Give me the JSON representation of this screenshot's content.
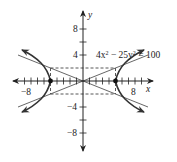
{
  "diagram": {
    "type": "hyperbola-graph",
    "equation": "4x² − 25y² = 100",
    "equation_parts": {
      "a": "4x",
      "sup1": "2",
      "b": " − 25y",
      "sup2": "2",
      "c": " = 100"
    },
    "axes": {
      "x_label": "x",
      "y_label": "y",
      "x_tick_labels": [
        "−8",
        "8"
      ],
      "y_tick_labels": [
        "8",
        "4",
        "−4",
        "−8"
      ],
      "x_range": [
        -10,
        10
      ],
      "y_range": [
        -10,
        10
      ],
      "tick_step": 1
    },
    "vertices": [
      [
        -5,
        0
      ],
      [
        5,
        0
      ]
    ],
    "asymptotes": [
      "y = 2x/5",
      "y = −2x/5"
    ],
    "central_rectangle": {
      "x": [
        -5,
        5
      ],
      "y": [
        -2,
        2
      ]
    },
    "colors": {
      "curve": "#333333",
      "axis": "#222222",
      "dashed": "#444444"
    }
  }
}
